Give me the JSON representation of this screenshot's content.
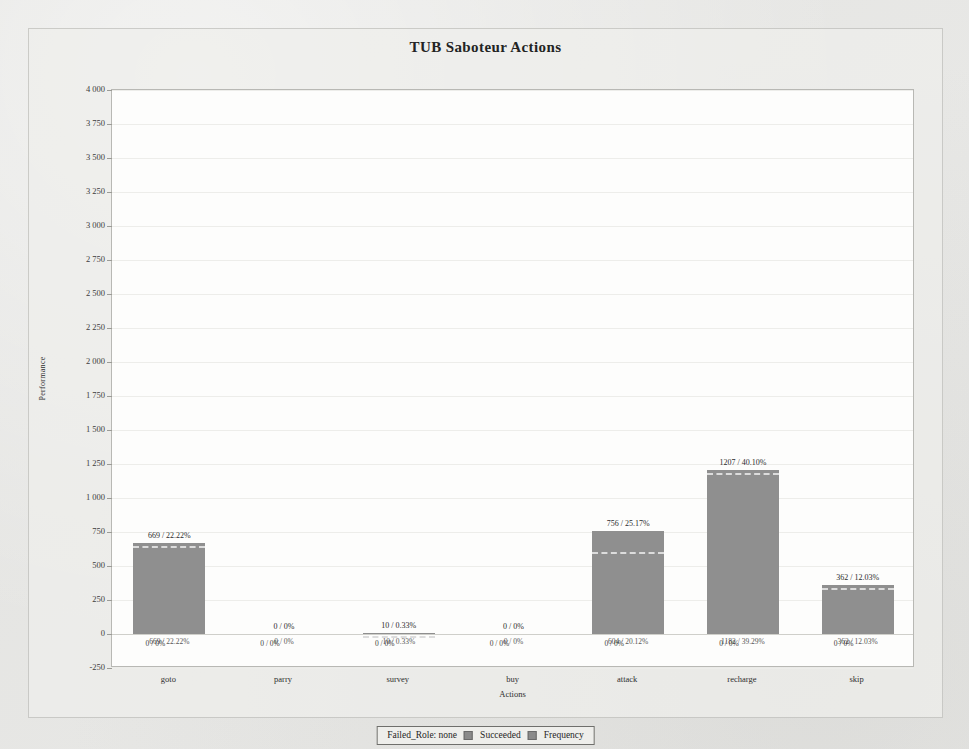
{
  "chart_data": {
    "type": "bar",
    "title": "TUB Saboteur Actions",
    "xlabel": "Actions",
    "ylabel": "Performance",
    "categories": [
      "goto",
      "parry",
      "survey",
      "buy",
      "attack",
      "recharge",
      "skip"
    ],
    "series": [
      {
        "name": "Frequency",
        "values": [
          669,
          0,
          10,
          0,
          756,
          1207,
          362
        ]
      },
      {
        "name": "Succeeded",
        "values": [
          669,
          0,
          10,
          0,
          604,
          1182,
          362
        ]
      },
      {
        "name": "Failed_Role: none",
        "values": [
          0,
          0,
          0,
          0,
          0,
          0,
          0
        ]
      }
    ],
    "ylim": [
      -250,
      4000
    ],
    "ytick_step": 250,
    "ytick_labels": [
      "4 000",
      "3 750",
      "3 500",
      "3 250",
      "3 000",
      "2 750",
      "2 500",
      "2 250",
      "2 000",
      "1 750",
      "1 500",
      "1 250",
      "1 000",
      "750",
      "500",
      "250",
      "0",
      "-250"
    ],
    "grid": true,
    "legend_position": "bottom",
    "bar_color": "#8f8f8f",
    "succeeded_line_color": "#dcdcdc",
    "plot_background": "#fdfdfc",
    "panel_background": "#eeeeeb",
    "data_labels_top": [
      "669 / 22.22%",
      "0 / 0%",
      "10 / 0.33%",
      "0 / 0%",
      "756 / 25.17%",
      "1207 / 40.10%",
      "362 / 12.03%"
    ],
    "data_labels_base_primary": [
      "669 / 22.22%",
      "0 / 0%",
      "10 / 0.33%",
      "0 / 0%",
      "604 / 20.12%",
      "1182 / 39.29%",
      "362 / 12.03%"
    ],
    "data_labels_base_secondary": [
      "0 / 0%",
      "0 / 0%",
      "0 / 0%",
      "0 / 0%",
      "0 / 0%",
      "0 / 0%",
      "0 / 0%"
    ]
  },
  "legend": {
    "entries": [
      {
        "label": "Failed_Role: none",
        "swatch": false
      },
      {
        "label": "Succeeded",
        "swatch": true
      },
      {
        "label": "Frequency",
        "swatch": true
      }
    ]
  }
}
